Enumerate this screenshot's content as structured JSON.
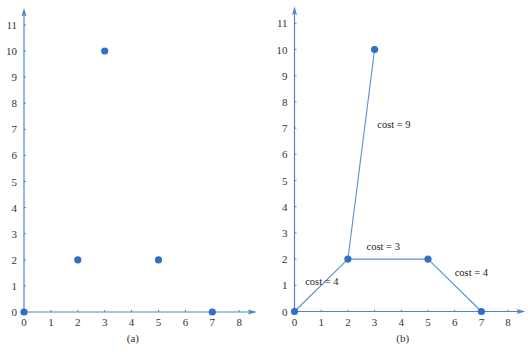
{
  "colors": {
    "accent": "#2f6fc4",
    "axis": "#4a86d0",
    "text": "#333333"
  },
  "chart_data": [
    {
      "type": "scatter",
      "caption": "(a)",
      "title": "",
      "xlabel": "",
      "ylabel": "",
      "xlim": [
        0,
        8
      ],
      "ylim": [
        0,
        11
      ],
      "x_ticks": [
        "0",
        "1",
        "2",
        "3",
        "4",
        "5",
        "6",
        "7",
        "8"
      ],
      "y_ticks": [
        "0",
        "1",
        "2",
        "3",
        "4",
        "5",
        "6",
        "7",
        "8",
        "9",
        "10",
        "11"
      ],
      "grid": false,
      "points": [
        {
          "x": 0,
          "y": 0
        },
        {
          "x": 2,
          "y": 2
        },
        {
          "x": 3,
          "y": 10
        },
        {
          "x": 5,
          "y": 2
        },
        {
          "x": 7,
          "y": 0
        }
      ]
    },
    {
      "type": "scatter",
      "caption": "(b)",
      "title": "",
      "xlabel": "",
      "ylabel": "",
      "xlim": [
        0,
        8
      ],
      "ylim": [
        0,
        11
      ],
      "x_ticks": [
        "0",
        "1",
        "2",
        "3",
        "4",
        "5",
        "6",
        "7",
        "8"
      ],
      "y_ticks": [
        "0",
        "1",
        "2",
        "3",
        "4",
        "5",
        "6",
        "7",
        "8",
        "9",
        "10",
        "11"
      ],
      "grid": false,
      "points": [
        {
          "x": 0,
          "y": 0
        },
        {
          "x": 2,
          "y": 2
        },
        {
          "x": 3,
          "y": 10
        },
        {
          "x": 5,
          "y": 2
        },
        {
          "x": 7,
          "y": 0
        }
      ],
      "edges": [
        {
          "from": [
            0,
            0
          ],
          "to": [
            2,
            2
          ],
          "label": "cost = 4",
          "label_pos": [
            0.4,
            1.0
          ]
        },
        {
          "from": [
            2,
            2
          ],
          "to": [
            3,
            10
          ],
          "label": "cost = 9",
          "label_pos": [
            3.1,
            7.0
          ]
        },
        {
          "from": [
            2,
            2
          ],
          "to": [
            5,
            2
          ],
          "label": "cost = 3",
          "label_pos": [
            2.7,
            2.35
          ]
        },
        {
          "from": [
            5,
            2
          ],
          "to": [
            7,
            0
          ],
          "label": "cost = 4",
          "label_pos": [
            6.0,
            1.35
          ]
        }
      ]
    }
  ]
}
